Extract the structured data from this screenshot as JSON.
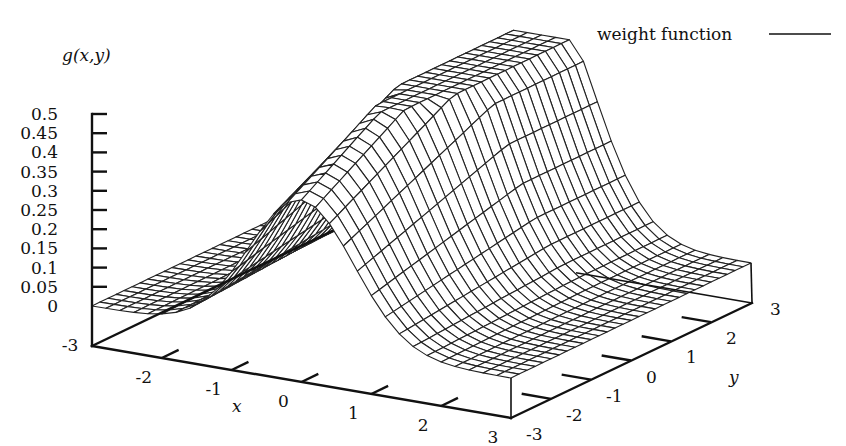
{
  "chart_data": {
    "type": "surface3d",
    "title": "",
    "zlabel": "g(x,y)",
    "xlabel": "x",
    "ylabel": "y",
    "legend": {
      "entries": [
        {
          "label": "weight function",
          "style": "solid"
        }
      ],
      "placement": "top-right"
    },
    "xlim": [
      -3,
      3
    ],
    "ylim": [
      -3,
      3
    ],
    "zlim": [
      0,
      0.5
    ],
    "xticks": [
      "-3",
      "-2",
      "-1",
      "0",
      "1",
      "2",
      "3"
    ],
    "yticks": [
      "-3",
      "-2",
      "-1",
      "0",
      "1",
      "2",
      "3"
    ],
    "zticks": [
      "0",
      "0.05",
      "0.1",
      "0.15",
      "0.2",
      "0.25",
      "0.3",
      "0.35",
      "0.4",
      "0.45",
      "0.5"
    ],
    "surface": {
      "description": "Gaussian ridge in x, clipped at z=0.5, rendered as a hidden-line wireframe mesh",
      "x_samples": 30,
      "y_samples": 30,
      "peak_value": 0.5,
      "ridge_center_x": 0,
      "ridge_sigma_x": 0.75,
      "front_peak_value": 0.37,
      "grid": true
    }
  }
}
